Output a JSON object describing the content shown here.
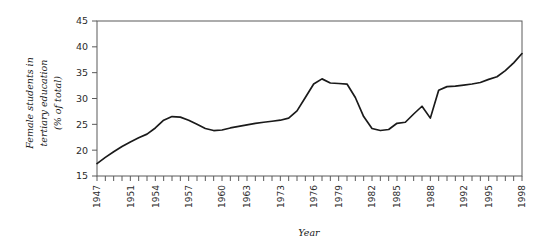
{
  "chart_data": {
    "type": "line",
    "title": "",
    "xlabel": "Year",
    "ylabel": "Female students in tertiary education (% of total)",
    "ylabel_lines": [
      "Female students in",
      "tertiary education",
      "(% of total)"
    ],
    "ylim": [
      15,
      45
    ],
    "xlim": [
      1947,
      1998
    ],
    "yticks": [
      15,
      20,
      25,
      30,
      35,
      40,
      45
    ],
    "ytick_labels": [
      "15",
      "20",
      "25",
      "30",
      "35",
      "40",
      "45"
    ],
    "xtick_labels": [
      "1947",
      "1951",
      "1954",
      "1957",
      "1960",
      "1963",
      "1973",
      "1976",
      "1979",
      "1982",
      "1985",
      "1988",
      "1992",
      "1995",
      "1998"
    ],
    "xtick_label_rotation": -90,
    "grid": false,
    "legend": false,
    "line_color": "#1a1a1a",
    "axis_color": "#5a5a5a",
    "x": [
      1947,
      1948,
      1949,
      1950,
      1951,
      1952,
      1953,
      1954,
      1955,
      1956,
      1957,
      1958,
      1959,
      1960,
      1961,
      1962,
      1963,
      1964,
      1965,
      1966,
      1967,
      1968,
      1969,
      1970,
      1971,
      1972,
      1973,
      1974,
      1975,
      1976,
      1977,
      1978,
      1979,
      1980,
      1981,
      1982,
      1983,
      1984,
      1985,
      1986,
      1987,
      1988,
      1989,
      1990,
      1991,
      1992,
      1993,
      1994,
      1995,
      1996,
      1997,
      1998
    ],
    "values": [
      17.4,
      18.6,
      19.7,
      20.7,
      21.6,
      22.4,
      23.1,
      24.3,
      25.8,
      26.5,
      26.4,
      25.8,
      25.0,
      24.2,
      23.8,
      23.9,
      24.3,
      24.6,
      24.9,
      25.2,
      25.4,
      25.6,
      25.8,
      26.2,
      27.6,
      30.2,
      32.8,
      33.8,
      33.0,
      32.9,
      32.8,
      30.2,
      26.5,
      24.2,
      23.8,
      24.0,
      25.2,
      25.4,
      27.0,
      28.5,
      26.2,
      31.6,
      32.3,
      32.4,
      32.6,
      32.8,
      33.1,
      33.7,
      34.2,
      35.4,
      36.9,
      38.7
    ]
  }
}
